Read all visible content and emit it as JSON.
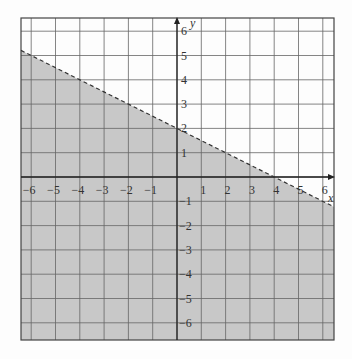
{
  "chart_data": {
    "type": "area",
    "title": "",
    "xlabel": "x",
    "ylabel": "y",
    "xlim": [
      -6.5,
      6.4
    ],
    "ylim": [
      -6.8,
      6.5
    ],
    "grid": true,
    "x_ticks": [
      "-6",
      "-5",
      "-4",
      "-3",
      "-2",
      "-1",
      "1",
      "2",
      "3",
      "4",
      "5",
      "6"
    ],
    "y_ticks": [
      "6",
      "5",
      "4",
      "3",
      "2",
      "1",
      "-1",
      "-2",
      "-3",
      "-4",
      "-5",
      "-6"
    ],
    "boundary_line": {
      "equation": "y = -x/2 + 2",
      "slope": -0.5,
      "intercept": 2,
      "style": "dashed",
      "points": [
        [
          -6.5,
          5.25
        ],
        [
          6.4,
          -1.2
        ]
      ]
    },
    "shaded_region": "below line (y < -x/2 + 2)",
    "colors": {
      "shade": "#c8c8c8",
      "grid": "#666666",
      "line": "#333333",
      "background": "#fdfdfd"
    }
  }
}
